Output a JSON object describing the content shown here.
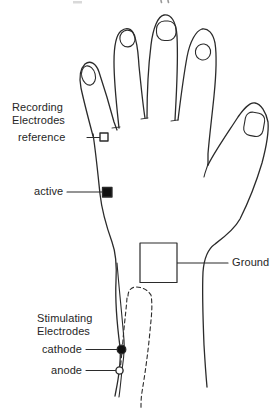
{
  "illustration": "dorsal-hand-and-wrist-line-drawing",
  "colors": {
    "ink": "#2b2b2b",
    "background": "#ffffff"
  },
  "annotations": {
    "recording": {
      "heading": "Recording\nElectrodes",
      "reference_label": "reference",
      "active_label": "active"
    },
    "ground_label": "Ground",
    "stimulating": {
      "heading": "Stimulating\nElectrodes",
      "cathode_label": "cathode",
      "anode_label": "anode"
    }
  },
  "markers": {
    "reference": "small-open-square-electrode",
    "active": "small-filled-square-electrode",
    "ground": "large-open-square-electrode",
    "cathode": "small-filled-circle-electrode",
    "anode": "small-open-circle-electrode"
  }
}
